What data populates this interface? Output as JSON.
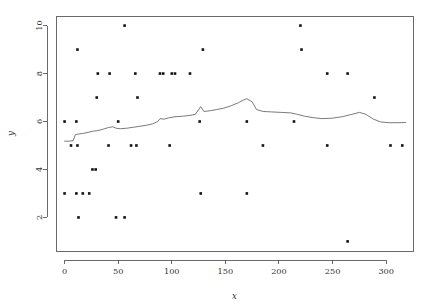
{
  "chart_data": {
    "type": "scatter",
    "title": "",
    "subtitle": "",
    "xlabel": "x",
    "ylabel": "y",
    "xlim": [
      -8,
      325
    ],
    "ylim": [
      0.6,
      10.4
    ],
    "xticks": [
      0,
      50,
      100,
      150,
      200,
      250,
      300
    ],
    "xticklabels": [
      "0",
      "50",
      "100",
      "150",
      "200",
      "250",
      "300"
    ],
    "yticks": [
      2,
      4,
      6,
      8,
      10
    ],
    "yticklabels": [
      "2",
      "4",
      "6",
      "8",
      "10"
    ],
    "grid": false,
    "legend": null,
    "marker": "filled-square-small",
    "point_color": "#111111",
    "line_color": "#6b6b6b",
    "axis_color": "#5a5a5a",
    "background": "#ffffff",
    "series": [
      {
        "name": "observations",
        "type": "scatter",
        "points": [
          [
            0,
            6
          ],
          [
            11,
            6
          ],
          [
            6,
            5
          ],
          [
            12,
            5
          ],
          [
            0,
            3
          ],
          [
            11,
            3
          ],
          [
            17,
            3
          ],
          [
            23,
            3
          ],
          [
            13,
            2
          ],
          [
            12,
            9
          ],
          [
            26,
            4
          ],
          [
            29,
            4
          ],
          [
            30,
            7
          ],
          [
            41,
            5
          ],
          [
            31,
            8
          ],
          [
            48,
            2
          ],
          [
            56,
            2
          ],
          [
            42,
            8
          ],
          [
            50,
            6
          ],
          [
            56,
            10
          ],
          [
            62,
            5
          ],
          [
            67,
            5
          ],
          [
            66,
            8
          ],
          [
            68,
            7
          ],
          [
            89,
            8
          ],
          [
            92,
            8
          ],
          [
            100,
            8
          ],
          [
            103,
            8
          ],
          [
            98,
            5
          ],
          [
            117,
            8
          ],
          [
            127,
            3
          ],
          [
            129,
            9
          ],
          [
            126,
            6
          ],
          [
            170,
            6
          ],
          [
            170,
            3
          ],
          [
            185,
            5
          ],
          [
            214,
            6
          ],
          [
            220,
            10
          ],
          [
            221,
            9
          ],
          [
            245,
            8
          ],
          [
            245,
            5
          ],
          [
            264,
            8
          ],
          [
            264,
            1
          ],
          [
            289,
            7
          ],
          [
            304,
            5
          ],
          [
            315,
            5
          ]
        ]
      },
      {
        "name": "smoothed-trend",
        "type": "line",
        "points": [
          [
            0,
            5.18
          ],
          [
            4,
            5.18
          ],
          [
            8,
            5.2
          ],
          [
            10,
            5.45
          ],
          [
            13,
            5.48
          ],
          [
            17,
            5.5
          ],
          [
            22,
            5.55
          ],
          [
            27,
            5.6
          ],
          [
            31,
            5.62
          ],
          [
            36,
            5.68
          ],
          [
            41,
            5.75
          ],
          [
            45,
            5.78
          ],
          [
            48,
            5.72
          ],
          [
            52,
            5.7
          ],
          [
            58,
            5.72
          ],
          [
            64,
            5.76
          ],
          [
            70,
            5.8
          ],
          [
            76,
            5.84
          ],
          [
            82,
            5.9
          ],
          [
            87,
            6.0
          ],
          [
            89,
            6.12
          ],
          [
            93,
            6.1
          ],
          [
            97,
            6.15
          ],
          [
            103,
            6.2
          ],
          [
            110,
            6.22
          ],
          [
            116,
            6.25
          ],
          [
            122,
            6.3
          ],
          [
            127,
            6.62
          ],
          [
            130,
            6.42
          ],
          [
            136,
            6.45
          ],
          [
            142,
            6.5
          ],
          [
            148,
            6.55
          ],
          [
            155,
            6.65
          ],
          [
            162,
            6.78
          ],
          [
            167,
            6.9
          ],
          [
            170,
            6.95
          ],
          [
            175,
            6.82
          ],
          [
            179,
            6.5
          ],
          [
            185,
            6.42
          ],
          [
            193,
            6.4
          ],
          [
            202,
            6.38
          ],
          [
            211,
            6.36
          ],
          [
            217,
            6.3
          ],
          [
            224,
            6.22
          ],
          [
            232,
            6.16
          ],
          [
            240,
            6.12
          ],
          [
            250,
            6.14
          ],
          [
            259,
            6.2
          ],
          [
            268,
            6.3
          ],
          [
            275,
            6.38
          ],
          [
            281,
            6.3
          ],
          [
            288,
            6.1
          ],
          [
            295,
            5.98
          ],
          [
            303,
            5.95
          ],
          [
            312,
            5.95
          ],
          [
            318,
            5.96
          ]
        ]
      }
    ]
  },
  "axes": {
    "x_title": "x",
    "y_title": "y"
  }
}
